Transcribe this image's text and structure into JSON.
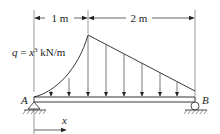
{
  "diagram": {
    "type": "simply-supported-beam",
    "dimensions": [
      {
        "label": "1 m",
        "from": "A",
        "to": "peak"
      },
      {
        "label": "2 m",
        "from": "peak",
        "to": "B"
      }
    ],
    "load": {
      "label_q": "q",
      "label_eq": " = ",
      "label_x": "x",
      "label_exp": "3",
      "label_unit": " kN/m",
      "description": "cubic distributed load rising from A to peak at 1 m, then linearly decreasing to zero at B",
      "arrow_count": 8
    },
    "supports": {
      "A": {
        "label": "A",
        "type": "pin"
      },
      "B": {
        "label": "B",
        "type": "roller"
      }
    },
    "axis": {
      "label": "x"
    },
    "colors": {
      "line": "#222222",
      "ground": "#444444"
    }
  }
}
